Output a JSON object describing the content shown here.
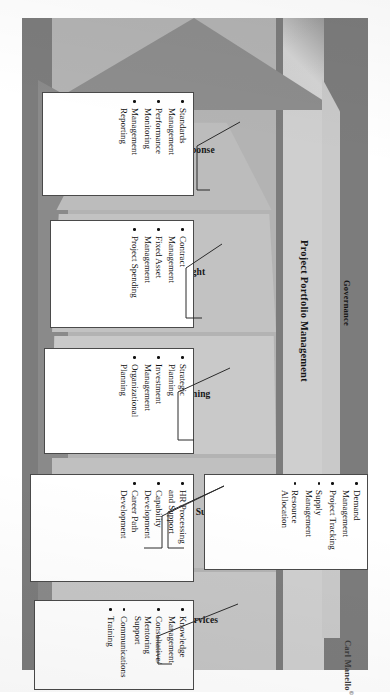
{
  "diagram": {
    "credit": "Carl Manello",
    "credit_mark": "©",
    "bands": [
      {
        "id": "governance",
        "label": "Governance",
        "color": "#7c7c7c"
      },
      {
        "id": "ppm",
        "label": "Project Portfolio Management",
        "color": "#cfcfcf"
      }
    ],
    "tiers": [
      {
        "id": "reporting-and-response",
        "label": "Reporting and\nResponse"
      },
      {
        "id": "financial-oversight",
        "label": "Financial\nOversight"
      },
      {
        "id": "strategy-and-planning",
        "label": "Strategy and\nPlanning"
      },
      {
        "id": "resource-management-support",
        "label": "Resource\nManagement\nSupport"
      },
      {
        "id": "delivery-support-services",
        "label": "Delivery\nSupport\nServices"
      }
    ],
    "callouts": [
      {
        "id": "reporting-and-response",
        "items": [
          "Standards\nManagement",
          "Performance\nMonitoring",
          "Management\nReporting"
        ]
      },
      {
        "id": "financial-oversight",
        "items": [
          "Contract\nManagement",
          "Fixed Asset\nManagement",
          "Project Spending"
        ]
      },
      {
        "id": "strategy-and-planning",
        "items": [
          "Strategic\nPlanning",
          "Investment\nManagement",
          "Organizational\nPlanning"
        ]
      },
      {
        "id": "resource-management-support-hr",
        "items": [
          "HR Processing\nand Support",
          "Capability\nDevelopment",
          "Career Path\nDevelopment"
        ]
      },
      {
        "id": "resource-management-support-demand",
        "items": [
          "Demand\nManagement",
          "Project Tracking",
          "Supply\nManagement",
          "Resource Allocation"
        ]
      },
      {
        "id": "delivery-support-services",
        "items": [
          "Knowledge\nManagement",
          "Consultative/\nMentoring Support",
          "Communications",
          "Training"
        ]
      }
    ]
  }
}
